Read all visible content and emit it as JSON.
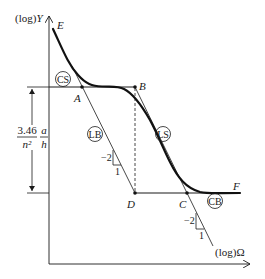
{
  "axes": {
    "y_label_prefix": "(log)",
    "y_label_var": "Y",
    "x_label": "(log)Ω"
  },
  "points": {
    "E": "E",
    "A": "A",
    "B": "B",
    "C": "C",
    "D": "D",
    "F": "F"
  },
  "regions": {
    "CS": "CS",
    "LB": "LB",
    "LS": "LS",
    "CB": "CB"
  },
  "dimension": {
    "numerator": "3.46",
    "denominator": "n²",
    "frac2_numerator": "a",
    "frac2_denominator": "h"
  },
  "slopes": {
    "lb_rise": "−2",
    "lb_run": "1",
    "ls_rise": "−2",
    "ls_run": "1"
  }
}
